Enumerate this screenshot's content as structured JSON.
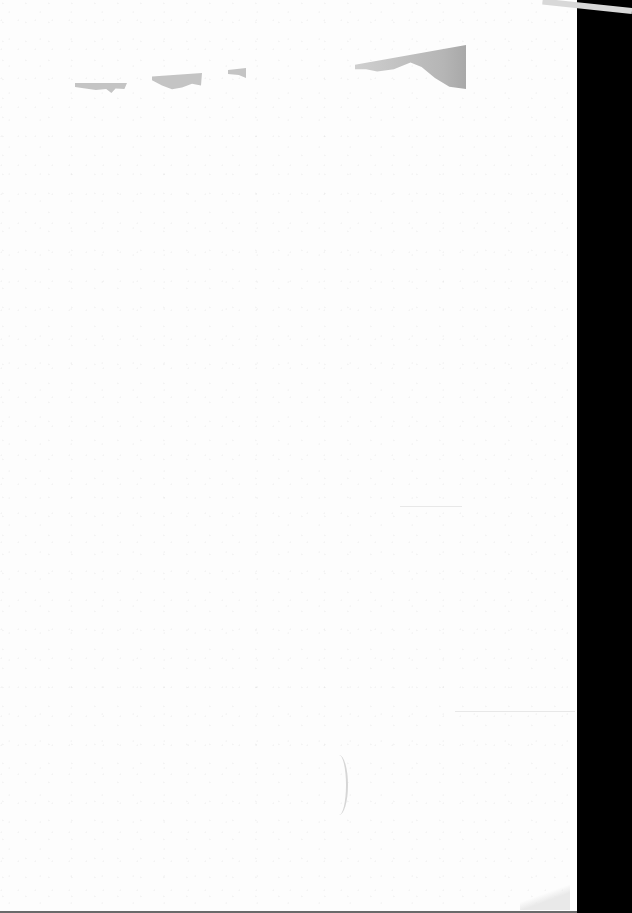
{
  "document": {
    "type": "scanned-page",
    "description": "Blank scanned sheet with no legible text",
    "visible_text": ""
  },
  "colors": {
    "page": "#fdfdfd",
    "background": "#000000",
    "smudge": "#c4c4c4"
  }
}
